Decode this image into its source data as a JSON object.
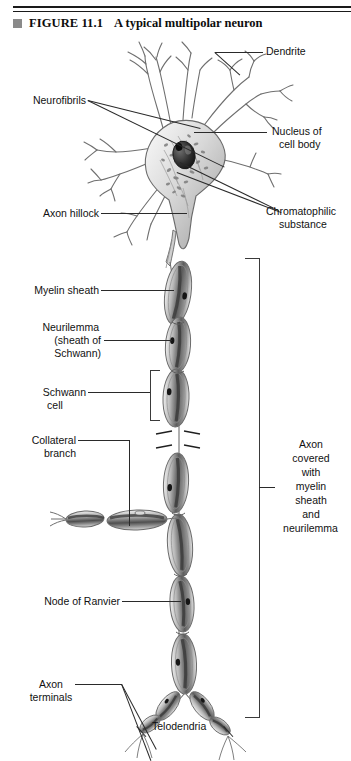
{
  "figure": {
    "marker_icon": "filled-square-bullet",
    "number_label": "FIGURE 11.1",
    "title": "A typical multipolar neuron"
  },
  "labels": {
    "dendrite": "Dendrite",
    "neurofibrils": "Neurofibrils",
    "nucleus_line1": "Nucleus of",
    "nucleus_line2": "cell body",
    "axon_hillock": "Axon hillock",
    "chromatophilic_line1": "Chromatophilic",
    "chromatophilic_line2": "substance",
    "myelin_sheath": "Myelin sheath",
    "neurilemma_line1": "Neurilemma",
    "neurilemma_line2": "(sheath of",
    "neurilemma_line3": "Schwann)",
    "schwann_line1": "Schwann",
    "schwann_line2": "cell",
    "collateral_line1": "Collateral",
    "collateral_line2": "branch",
    "axon_covered_line1": "Axon",
    "axon_covered_line2": "covered",
    "axon_covered_line3": "with",
    "axon_covered_line4": "myelin",
    "axon_covered_line5": "sheath",
    "axon_covered_line6": "and",
    "axon_covered_line7": "neurilemma",
    "node_of_ranvier": "Node of Ranvier",
    "axon_terminals_line1": "Axon",
    "axon_terminals_line2": "terminals",
    "telodendria": "Telodendria"
  },
  "colors": {
    "ink": "#111111",
    "rule": "#1a1a1a",
    "marker": "#8a8a8a",
    "leader": "#2a2a2a",
    "paper": "#ffffff",
    "cell_fill": "#b9b9b9",
    "cell_dark": "#4a4a4a",
    "nucleus": "#2b2b2b"
  },
  "diagram": {
    "type": "labeled-anatomical-illustration",
    "subject": "multipolar neuron",
    "parts": [
      "dendrites",
      "cell body (soma)",
      "nucleus",
      "neurofibrils",
      "chromatophilic substance",
      "axon hillock",
      "axon",
      "myelin sheath",
      "neurilemma (sheath of Schwann)",
      "Schwann cell",
      "collateral branch",
      "nodes of Ranvier",
      "axon terminals",
      "telodendria"
    ]
  }
}
